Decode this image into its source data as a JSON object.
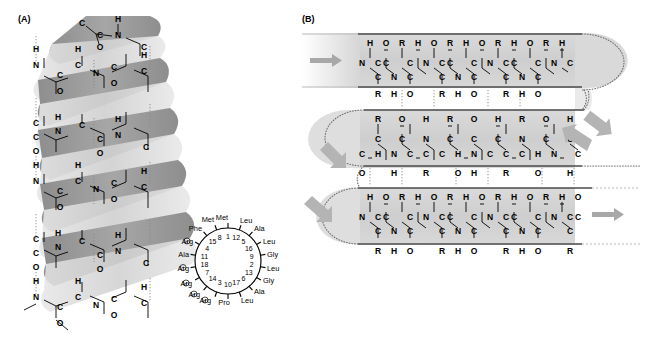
{
  "figure": {
    "panels": [
      {
        "id": "A",
        "label": "(A)",
        "caption_none": ""
      },
      {
        "id": "B",
        "label": "(B)",
        "caption_none": ""
      }
    ]
  },
  "panel_a": {
    "label": "(A)",
    "structure_name": "alpha-helix",
    "atoms": [
      "C",
      "N",
      "O",
      "H"
    ],
    "backbone_repeat": [
      "H",
      "N",
      "C",
      "C",
      "O"
    ],
    "helical_wheel": {
      "residues_clockwise_from_top": [
        {
          "position": 1,
          "residue": "Met",
          "charge": ""
        },
        {
          "position": 12,
          "residue": "Leu",
          "charge": ""
        },
        {
          "position": 5,
          "residue": "Ala",
          "charge": ""
        },
        {
          "position": 16,
          "residue": "Leu",
          "charge": ""
        },
        {
          "position": 9,
          "residue": "Gly",
          "charge": ""
        },
        {
          "position": 2,
          "residue": "Leu",
          "charge": ""
        },
        {
          "position": 13,
          "residue": "Gly",
          "charge": ""
        },
        {
          "position": 6,
          "residue": "Ala",
          "charge": ""
        },
        {
          "position": 17,
          "residue": "Leu",
          "charge": ""
        },
        {
          "position": 10,
          "residue": "Pro",
          "charge": ""
        },
        {
          "position": 3,
          "residue": "Arg",
          "charge": "+"
        },
        {
          "position": 14,
          "residue": "Arg",
          "charge": "+"
        },
        {
          "position": 7,
          "residue": "Arg",
          "charge": "+"
        },
        {
          "position": 18,
          "residue": "Arg",
          "charge": "+"
        },
        {
          "position": 11,
          "residue": "Arg",
          "charge": "+"
        },
        {
          "position": 4,
          "residue": "Ala",
          "charge": ""
        },
        {
          "position": 15,
          "residue": "Phe",
          "charge": ""
        },
        {
          "position": 8,
          "residue": "Met",
          "charge": ""
        }
      ],
      "charge_glyph": "+"
    }
  },
  "panel_b": {
    "label": "(B)",
    "structure_name": "antiparallel-beta-sheet",
    "strand_count": 3,
    "strands": [
      {
        "index": 1,
        "direction": "right",
        "top_atoms": [
          "H",
          "O",
          "R",
          "H",
          "O",
          "R",
          "H",
          "O"
        ],
        "mid_atoms": [
          "N",
          "C",
          "C",
          "C",
          "N",
          "C",
          "C",
          "C",
          "N",
          "C",
          "C"
        ],
        "bottom_atoms": [
          "R",
          "H",
          "O",
          "R",
          "H",
          "O",
          "R"
        ]
      },
      {
        "index": 2,
        "direction": "left",
        "top_atoms": [
          "R",
          "O",
          "H",
          "R",
          "O",
          "H",
          "R"
        ],
        "mid_atoms": [
          "C",
          "C",
          "N",
          "C",
          "C",
          "C",
          "N",
          "C",
          "C",
          "C",
          "N"
        ],
        "bottom_atoms": [
          "O",
          "H",
          "R",
          "O",
          "H",
          "R",
          "O",
          "H"
        ]
      },
      {
        "index": 3,
        "direction": "right",
        "top_atoms": [
          "H",
          "O",
          "R",
          "H",
          "O",
          "R",
          "H",
          "O"
        ],
        "mid_atoms": [
          "N",
          "C",
          "C",
          "C",
          "N",
          "C",
          "C",
          "C",
          "N",
          "C",
          "C"
        ],
        "bottom_atoms": [
          "R",
          "H",
          "O",
          "R",
          "H",
          "O",
          "R"
        ]
      }
    ],
    "hydrogen_bond_style": "dotted",
    "arrows": [
      {
        "id": "arrow-left-top",
        "direction": "right"
      },
      {
        "id": "arrow-right-turn1",
        "direction": "down-right"
      },
      {
        "id": "arrow-right-mid",
        "direction": "left"
      },
      {
        "id": "arrow-left-turn2",
        "direction": "down-left"
      },
      {
        "id": "arrow-left-bottom",
        "direction": "down-right"
      },
      {
        "id": "arrow-right-bottom",
        "direction": "right"
      }
    ]
  },
  "colors": {
    "ribbon_dark": "#9a9a9a",
    "ribbon_light": "#d8d8d8",
    "sheet_fill": "#d2d2d2",
    "arrow": "#a8a8a8",
    "line": "#000000",
    "background": "#ffffff"
  }
}
